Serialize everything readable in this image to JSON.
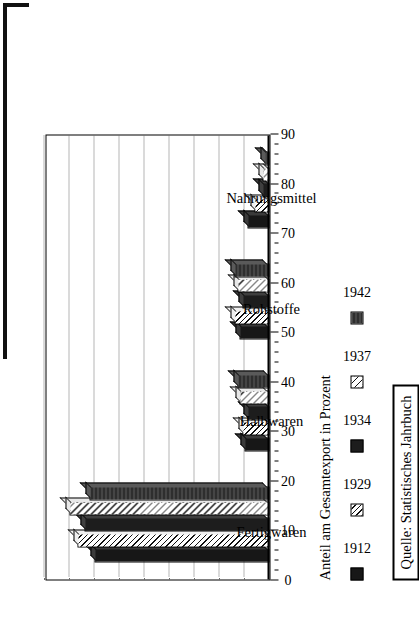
{
  "axis_title": "Anteil am Gesamtexport in Prozent",
  "source_note": "Quelle: Statistisches Jahrbuch",
  "legend": {
    "items": [
      {
        "label": "1912",
        "pattern": "p-solid-dark"
      },
      {
        "label": "1929",
        "pattern": "p-diag-light"
      },
      {
        "label": "1934",
        "pattern": "p-solid-dark2"
      },
      {
        "label": "1937",
        "pattern": "p-cross"
      },
      {
        "label": "1942",
        "pattern": "p-gray-dark"
      }
    ]
  },
  "chart_data": {
    "type": "bar",
    "title": "",
    "subtitle": "",
    "orientation": "horizontal",
    "rotated_90_ccw": true,
    "xlabel": "",
    "ylabel": "Anteil am Gesamtexport in Prozent",
    "ylim": [
      0,
      90
    ],
    "ytick_step": 10,
    "yticks": [
      90,
      80,
      70,
      60,
      50,
      40,
      30,
      20,
      10,
      0
    ],
    "ytick_labels": [
      "90",
      "80",
      "70",
      "60",
      "50",
      "40",
      "30",
      "20",
      "10",
      "0"
    ],
    "minor_tick_step": 2,
    "grid": true,
    "grid_style": "dotted",
    "legend_position": "bottom",
    "categories": [
      "Fertigwaren",
      "Halbwaren",
      "Rohstoffe",
      "Nahrungsmittel"
    ],
    "series": [
      {
        "name": "1912",
        "pattern": "p-solid-dark",
        "values": [
          70,
          10,
          12,
          9
        ]
      },
      {
        "name": "1929",
        "pattern": "p-diag-light",
        "values": [
          77,
          11,
          14,
          6
        ]
      },
      {
        "name": "1934",
        "pattern": "p-solid-dark2",
        "values": [
          74,
          9,
          11,
          3
        ]
      },
      {
        "name": "1937",
        "pattern": "p-cross",
        "values": [
          80,
          12,
          13,
          3
        ]
      },
      {
        "name": "1942",
        "pattern": "p-gray-dark",
        "values": [
          72,
          13,
          14,
          2
        ]
      }
    ],
    "annotations": [
      "Quelle: Statistisches Jahrbuch"
    ],
    "colors": {
      "axis": "#000000",
      "grid": "#6b6b6b",
      "background": "#ffffff",
      "series_1912": "#171717",
      "series_1929": "#efefef",
      "series_1934": "#1d1d1d",
      "series_1937": "#e8e8e8",
      "series_1942": "#3a3a3a"
    }
  }
}
